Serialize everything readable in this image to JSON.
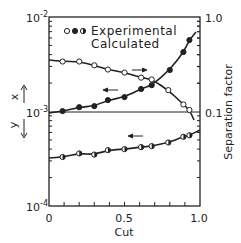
{
  "chart_data": {
    "type": "scatter",
    "title": "",
    "xlabel": "Cut",
    "ylabel_left_upper": "x",
    "ylabel_left_lower": "y",
    "ylabel_right": "Separation factor",
    "xlim": [
      0,
      1.0
    ],
    "ylim_left": [
      0.0001,
      0.01
    ],
    "ylim_right": [
      0.1,
      1.0
    ],
    "yscale_left": "log",
    "yscale_right": "log",
    "x_ticks": [
      "0",
      "0.5",
      "1.0"
    ],
    "y_ticks_left": [
      {
        "base": "10",
        "exp": "-2"
      },
      {
        "base": "10",
        "exp": "-3"
      },
      {
        "base": "10",
        "exp": "-4"
      }
    ],
    "y_ticks_right": [
      "1.0",
      "0.1"
    ],
    "grid": false,
    "legend": {
      "markers": [
        "open",
        "filled",
        "half"
      ],
      "entries": [
        "Experimental",
        "Calculated"
      ],
      "position": "upper-left"
    },
    "series": [
      {
        "name": "x (permeate concentration)",
        "axis": "left",
        "marker": "filled",
        "arrow": "left",
        "x": [
          0.09,
          0.2,
          0.3,
          0.39,
          0.5,
          0.61,
          0.68,
          0.8,
          0.89,
          0.93
        ],
        "values": [
          0.00101,
          0.00111,
          0.00114,
          0.00132,
          0.00142,
          0.00173,
          0.0019,
          0.00275,
          0.00426,
          0.0057
        ]
      },
      {
        "name": "y (retentate concentration)",
        "axis": "left",
        "marker": "half",
        "arrow": "left",
        "x": [
          0.09,
          0.2,
          0.3,
          0.39,
          0.5,
          0.61,
          0.68,
          0.79,
          0.89,
          0.93
        ],
        "values": [
          0.00033,
          0.00036,
          0.00035,
          0.00039,
          0.0004,
          0.00042,
          0.00043,
          0.00047,
          0.00054,
          0.00056
        ]
      },
      {
        "name": "Separation factor",
        "axis": "right",
        "marker": "open",
        "arrow": "right",
        "x": [
          0.09,
          0.2,
          0.3,
          0.39,
          0.5,
          0.61,
          0.68,
          0.79,
          0.89,
          0.93
        ],
        "values": [
          0.34,
          0.34,
          0.31,
          0.28,
          0.26,
          0.23,
          0.22,
          0.17,
          0.12,
          0.105
        ]
      }
    ],
    "reference_line": {
      "axis": "left",
      "value": 0.001,
      "note": "horizontal line at 10^-3 / 0.1"
    }
  }
}
